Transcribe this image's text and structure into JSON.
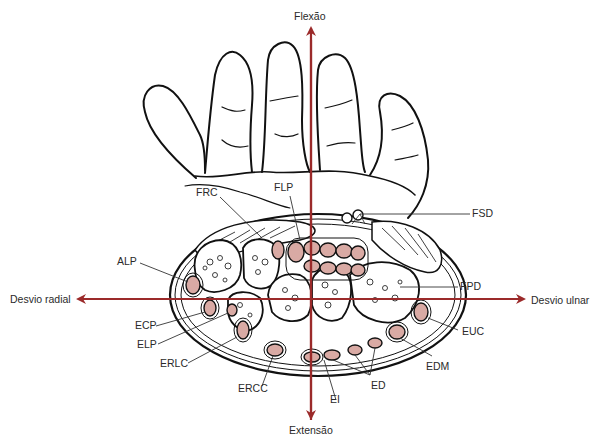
{
  "diagram": {
    "type": "anatomical cross-section of wrist with hand",
    "colors": {
      "axis_arrow": "#9b2a2a",
      "tendon_fill": "#d9aaa4",
      "outline": "#111111",
      "background": "#ffffff"
    },
    "axes": {
      "top": "Flexão",
      "bottom": "Extensão",
      "left": "Desvio radial",
      "right": "Desvio ulnar"
    },
    "labels": {
      "frc": "FRC",
      "flp": "FLP",
      "fsd": "FSD",
      "alp": "ALP",
      "fpd": "FPD",
      "ecp": "ECP",
      "elp": "ELP",
      "erlc": "ERLC",
      "ercc": "ERCC",
      "ei": "EI",
      "ed": "ED",
      "edm": "EDM",
      "euc": "EUC"
    }
  }
}
